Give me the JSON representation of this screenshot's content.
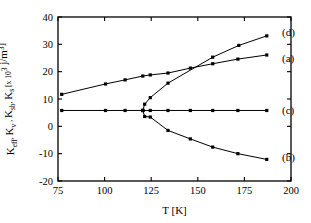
{
  "chart_data": {
    "type": "line",
    "title": "",
    "xlabel": "T  [K]",
    "ylabel": "K_eff, K_v, K_sb, K_s  [x 10^3 j/m^3]",
    "ylabel_parts": {
      "k1_base": "K",
      "k1_sub": "eff",
      "sep1": ", ",
      "k2_base": "K",
      "k2_sub": "v",
      "sep2": " , ",
      "k3_base": "K",
      "k3_sub": "sb",
      "sep3": ", ",
      "k4_base": "K",
      "k4_sub": "s",
      "units_open": "  [x 10",
      "units_exp": "3",
      "units_mid": "  j/m",
      "units_exp2": "3",
      "units_close": "]"
    },
    "xlabel_parts": {
      "symbol": "T",
      "unit": "[K]"
    },
    "xlim": [
      75,
      200
    ],
    "ylim": [
      -20,
      40
    ],
    "xticks": [
      75,
      100,
      125,
      150,
      175,
      200
    ],
    "yticks": [
      40,
      30,
      20,
      10,
      0,
      -10,
      -20
    ],
    "grid": false,
    "legend_position": "right-inline",
    "marker": "square",
    "line_color": "#000000",
    "series": [
      {
        "name": "(a)",
        "label": "(a)",
        "label_x": 192,
        "label_y": 25,
        "x": [
          77,
          100.5,
          111,
          120.5,
          124.5,
          134,
          146,
          158,
          171.5,
          187
        ],
        "y": [
          11.7,
          15.5,
          17.0,
          18.4,
          18.8,
          19.5,
          21.3,
          22.9,
          24.6,
          26.1
        ]
      },
      {
        "name": "(d)",
        "label": "(d)",
        "label_x": 192,
        "label_y": 34.6,
        "x": [
          120.5,
          121.5,
          124.5,
          134,
          158,
          172,
          187
        ],
        "y": [
          5.8,
          8.1,
          10.5,
          15.8,
          25.3,
          29.6,
          33.1
        ]
      },
      {
        "name": "(c)",
        "label": "(c)",
        "label_x": 192,
        "label_y": 5.8,
        "x": [
          77,
          100.5,
          111,
          120.5,
          124.5,
          134,
          146,
          158,
          171.5,
          187
        ],
        "y": [
          5.8,
          5.8,
          5.8,
          5.8,
          5.8,
          5.8,
          5.8,
          5.8,
          5.8,
          5.8
        ]
      },
      {
        "name": "(b)",
        "label": "(b)",
        "label_x": 192,
        "label_y": -11.2,
        "x": [
          120.5,
          121.5,
          124.5,
          134,
          146,
          158,
          171.5,
          187
        ],
        "y": [
          5.8,
          3.6,
          3.4,
          -1.5,
          -4.6,
          -7.6,
          -10.0,
          -12.1
        ]
      }
    ]
  }
}
